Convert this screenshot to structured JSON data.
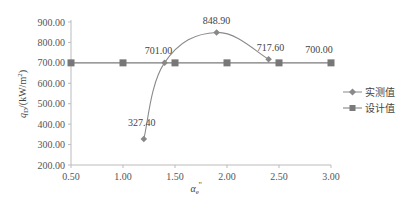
{
  "chart_data": {
    "type": "line",
    "title": "",
    "xlabel": "α_e''",
    "ylabel": "q_D/(kW/m²)",
    "xlim": [
      0.5,
      3.0
    ],
    "ylim": [
      200,
      900
    ],
    "x_ticks": [
      "0.50",
      "1.00",
      "1.50",
      "2.00",
      "2.50",
      "3.00"
    ],
    "y_ticks": [
      "200.00",
      "300.00",
      "400.00",
      "500.00",
      "600.00",
      "700.00",
      "800.00",
      "900.00"
    ],
    "grid": false,
    "legend_position": "right",
    "series": [
      {
        "name": "实测值",
        "marker": "diamond",
        "smooth": true,
        "color": "#8a8a8a",
        "x": [
          1.2,
          1.4,
          1.9,
          2.4
        ],
        "values": [
          327.4,
          701.0,
          848.9,
          717.6
        ],
        "labels": [
          "327.40",
          "701.00",
          "848.90",
          "717.60"
        ]
      },
      {
        "name": "设计值",
        "marker": "square",
        "smooth": false,
        "color": "#7a7a7a",
        "x": [
          0.5,
          1.0,
          1.5,
          2.0,
          2.5,
          3.0
        ],
        "values": [
          700,
          700,
          700,
          700,
          700,
          700
        ],
        "labels": [
          "700.00"
        ]
      }
    ]
  },
  "axis": {
    "ylabel_main": "q",
    "ylabel_sub": "D",
    "ylabel_rest": "/(kW/m",
    "ylabel_sup": "2",
    "ylabel_close": ")",
    "xlabel_main": "α",
    "xlabel_sub": "e",
    "xlabel_sup": "''"
  },
  "legend": {
    "measured": "实测值",
    "design": "设计值"
  }
}
